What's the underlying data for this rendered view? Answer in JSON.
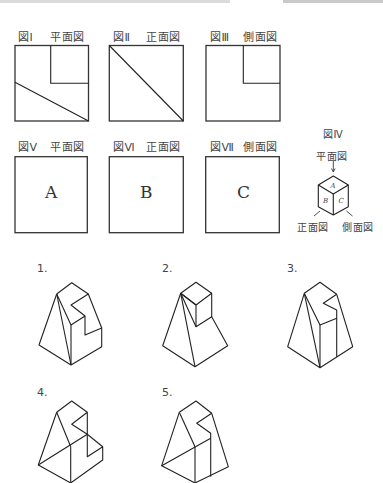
{
  "colors": {
    "ink": "#222222",
    "label": "#444444",
    "background": "#ffffff"
  },
  "views_row1": [
    {
      "fig": "図Ⅰ",
      "view": "平面図"
    },
    {
      "fig": "図Ⅱ",
      "view": "正面図"
    },
    {
      "fig": "図Ⅲ",
      "view": "側面図"
    }
  ],
  "views_row2": [
    {
      "fig": "図Ⅴ",
      "view": "平面図",
      "letter": "A"
    },
    {
      "fig": "図Ⅵ",
      "view": "正面図",
      "letter": "B"
    },
    {
      "fig": "図Ⅶ",
      "view": "側面図",
      "letter": "C"
    }
  ],
  "legend": {
    "fig": "図Ⅳ",
    "top_label": "平面図",
    "front_label": "正面図",
    "side_label": "側面図",
    "faces": {
      "top": "A",
      "front": "B",
      "side": "C"
    }
  },
  "options": [
    "1.",
    "2.",
    "3.",
    "4.",
    "5."
  ]
}
